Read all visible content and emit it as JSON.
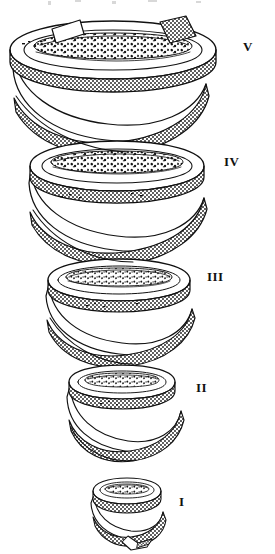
{
  "figure": {
    "background_color": "#ffffff",
    "ink_color": "#111111",
    "stipple_color": "#2a2a2a",
    "width": 275,
    "height": 554,
    "coil": {
      "turn_count": 5,
      "taper": "widest at top, narrowing toward bottom",
      "ribbon_style": "stippled band with granular inner core",
      "axis": "vertical",
      "handedness": "right-handed"
    },
    "levels": [
      {
        "id": "level-5",
        "label": "V",
        "label_x": 243,
        "label_y": 40,
        "ring_center_x": 113,
        "ring_center_y": 52,
        "ring_rx": 103,
        "ring_ry": 26,
        "band_width": 15,
        "has_core": true,
        "has_cut_end": true
      },
      {
        "id": "level-4",
        "label": "IV",
        "label_x": 224,
        "label_y": 155,
        "ring_center_x": 117,
        "ring_center_y": 167,
        "ring_rx": 87,
        "ring_ry": 23,
        "band_width": 14,
        "has_core": true,
        "has_cut_end": false
      },
      {
        "id": "level-3",
        "label": "III",
        "label_x": 207,
        "label_y": 270,
        "ring_center_x": 119,
        "ring_center_y": 281,
        "ring_rx": 71,
        "ring_ry": 20,
        "band_width": 13,
        "has_core": true,
        "has_cut_end": false
      },
      {
        "id": "level-2",
        "label": "II",
        "label_x": 196,
        "label_y": 381,
        "ring_center_x": 122,
        "ring_center_y": 383,
        "ring_rx": 52,
        "ring_ry": 16,
        "band_width": 12,
        "has_core": true,
        "has_cut_end": false
      },
      {
        "id": "level-1",
        "label": "I",
        "label_x": 179,
        "label_y": 495,
        "ring_center_x": 127,
        "ring_center_y": 492,
        "ring_rx": 33,
        "ring_ry": 12,
        "band_width": 10,
        "has_core": true,
        "has_cut_end": false
      }
    ]
  }
}
